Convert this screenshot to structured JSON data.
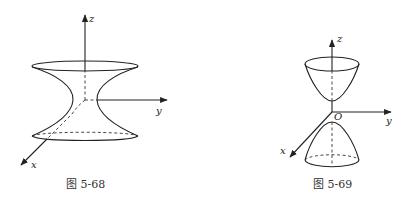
{
  "figures": [
    {
      "caption": "图 5-68",
      "surface": "hyperboloid of one sheet",
      "axes": {
        "x": "x",
        "y": "y",
        "z": "z"
      }
    },
    {
      "caption": "图 5-69",
      "surface": "hyperboloid of two sheets",
      "axes": {
        "x": "x",
        "y": "y",
        "z": "z"
      },
      "origin_label": "O"
    }
  ],
  "colors": {
    "stroke": "#222222",
    "background": "#ffffff"
  }
}
